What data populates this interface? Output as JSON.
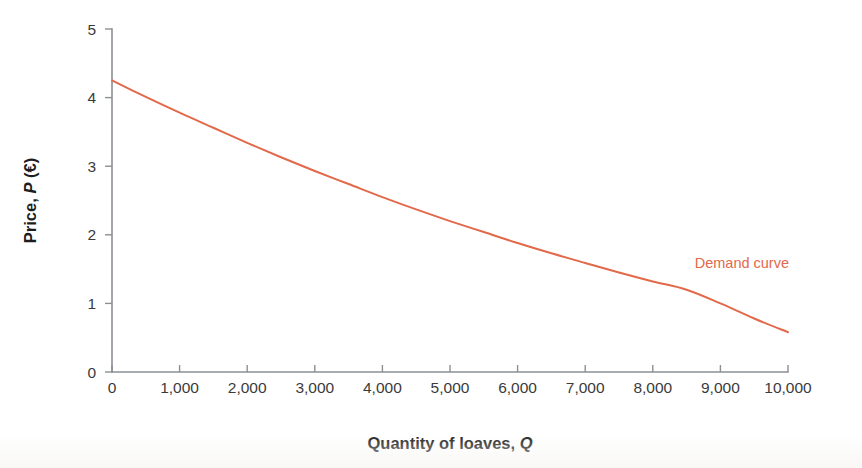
{
  "chart_data": {
    "type": "line",
    "title": "",
    "subtitle": "",
    "xlabel_parts": {
      "pre": "Quantity of loaves, ",
      "italic": "Q",
      "post": ""
    },
    "ylabel_parts": {
      "pre": "Price, ",
      "italic": "P",
      "post": " (€)"
    },
    "xlabel": "Quantity of loaves, Q",
    "ylabel": "Price, P (€)",
    "xlim": [
      0,
      10000
    ],
    "ylim": [
      0,
      5
    ],
    "grid": false,
    "legend_position": "inline-annotation",
    "xticks": [
      0,
      1000,
      2000,
      3000,
      4000,
      5000,
      6000,
      7000,
      8000,
      9000,
      10000
    ],
    "xticklabels": [
      "0",
      "1,000",
      "2,000",
      "3,000",
      "4,000",
      "5,000",
      "6,000",
      "7,000",
      "8,000",
      "9,000",
      "10,000"
    ],
    "yticks": [
      0,
      1,
      2,
      3,
      4,
      5
    ],
    "yticklabels": [
      "0",
      "1",
      "2",
      "3",
      "4",
      "5"
    ],
    "series": [
      {
        "name": "Demand curve",
        "color": "#e2694a",
        "x": [
          0,
          500,
          1000,
          1500,
          2000,
          2500,
          3000,
          3500,
          4000,
          4500,
          5000,
          5500,
          6000,
          6500,
          7000,
          7500,
          8000,
          8500,
          9000,
          9500,
          10000
        ],
        "y": [
          4.25,
          4.01,
          3.78,
          3.56,
          3.34,
          3.13,
          2.93,
          2.74,
          2.55,
          2.37,
          2.2,
          2.04,
          1.88,
          1.73,
          1.59,
          1.45,
          1.32,
          1.2,
          1.0,
          0.78,
          0.58
        ]
      }
    ],
    "annotations": [
      {
        "text": "Demand curve",
        "x": 8620,
        "y": 1.52,
        "color": "#e2694a"
      }
    ]
  },
  "colors": {
    "curve": "#e2694a",
    "axis": "#8b9096",
    "tick_label": "#3b3b3b",
    "axis_title": "#1d1d1d",
    "background": "#ffffff"
  }
}
